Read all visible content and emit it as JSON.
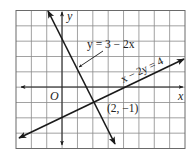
{
  "figure": {
    "type": "coordinate-plane-graph",
    "grid": {
      "columns": 11,
      "rows": 9,
      "x_range": [
        -3,
        8
      ],
      "y_range": [
        -4,
        5
      ],
      "grid_color": "#8a8a8a",
      "border_color": "#6a6a6a"
    },
    "axes": {
      "x_label": "x",
      "y_label": "y",
      "origin_label": "O",
      "color": "#222222"
    },
    "lines": [
      {
        "id": "line-1",
        "equation": "y = 3 − 2x",
        "label": "y = 3 − 2x",
        "slope": -2,
        "intercept": 3,
        "color": "#1a1a1a"
      },
      {
        "id": "line-2",
        "equation": "x − 2y = 4",
        "label": "x − 2y = 4",
        "slope": 0.5,
        "intercept": -2,
        "color": "#1a1a1a"
      }
    ],
    "intersection": {
      "label": "(2, −1)",
      "x": 2,
      "y": -1
    }
  }
}
